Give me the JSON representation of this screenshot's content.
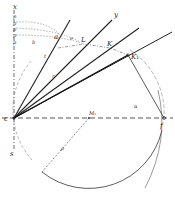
{
  "diagram": {
    "type": "geometric construction",
    "colors": {
      "ink": "#222222",
      "paper": "#ffffff",
      "faint": "#777777"
    },
    "points": {
      "origin": {
        "label": "c",
        "x": 14,
        "y": 118
      },
      "right_point": {
        "label": "f",
        "x": 164,
        "y": 118
      },
      "center": {
        "label": "M1",
        "x": 89,
        "y": 118
      },
      "K": {
        "label": "K",
        "x": 110,
        "y": 48
      },
      "K1": {
        "label": "K1",
        "x": 128,
        "y": 55
      },
      "L": {
        "label": "L",
        "x": 84,
        "y": 44
      },
      "a": {
        "label": "a",
        "x": 56,
        "y": 39
      }
    },
    "labels": {
      "x_axis_top": "x",
      "y_line": "y",
      "K": "K",
      "K1": "K₁",
      "L": "L",
      "a": "a",
      "origin": "c",
      "f": "f",
      "M1": "M₁",
      "s_bottom_left": "s",
      "rho": "ρ",
      "alpha": "α",
      "t": "t",
      "r": "r",
      "y_ticks": [
        "p",
        "p",
        "p",
        "p",
        "p"
      ],
      "b": "b",
      "e": "e"
    }
  }
}
